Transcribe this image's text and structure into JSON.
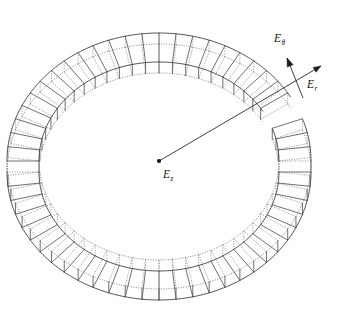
{
  "figure": {
    "background_color": "#ffffff",
    "line_color": "#4a4a4a",
    "dotted_color": "#6d6d6d",
    "vector_color": "#1c1c1c"
  },
  "labels": {
    "azimuthal": {
      "symbol": "E",
      "subscript": "θ",
      "text": "Eθ"
    },
    "radial": {
      "symbol": "E",
      "subscript": "r",
      "text": "Er"
    },
    "axial": {
      "symbol": "E",
      "subscript": "z",
      "text": "Ez"
    }
  },
  "geometry": {
    "center_x": 159,
    "center_y": 161,
    "outer_rx": 152,
    "outer_ry": 128,
    "inner_rx": 120,
    "inner_ry": 99,
    "depth_offset_x": 0,
    "depth_offset_y": 11,
    "segment_count": 56,
    "gap_start_deg": 330,
    "gap_end_deg": 341,
    "ring_extent_left_px": 18,
    "ring_extent_right_px": 330,
    "ring_extent_top_px": 22,
    "ring_extent_bottom_px": 300
  },
  "vectors": {
    "radial": {
      "from_x": 159,
      "from_y": 161,
      "to_x": 321,
      "to_y": 66,
      "arrowhead": "filled-triangle"
    },
    "azimuthal": {
      "from_x": 303,
      "from_y": 98,
      "to_x": 287,
      "to_y": 58,
      "arrowhead": "filled-triangle"
    },
    "center_marker": {
      "x": 159,
      "y": 161,
      "radius": 2.1
    }
  }
}
